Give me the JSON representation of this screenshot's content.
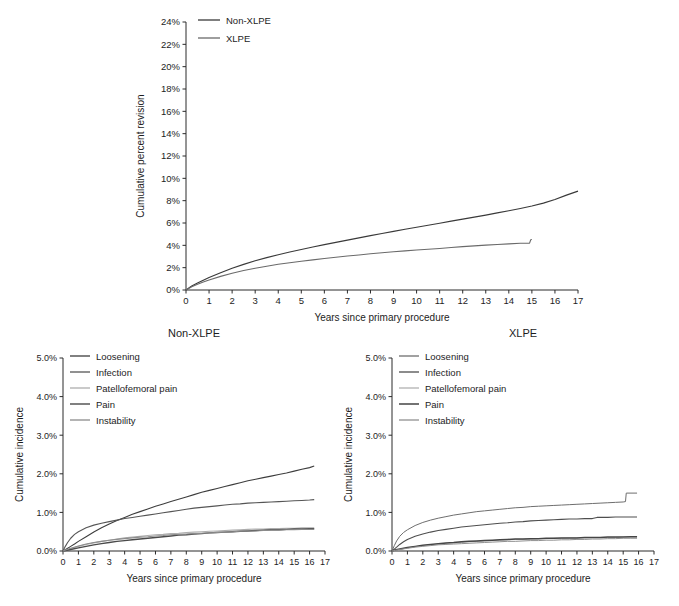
{
  "figure": {
    "title": "",
    "background": "#ffffff"
  },
  "chart_data": [
    {
      "id": "top",
      "type": "line",
      "title": "",
      "xlabel": "Years since primary procedure",
      "ylabel": "Cumulative percent revision",
      "xlim": [
        0,
        17
      ],
      "ylim": [
        0,
        24
      ],
      "xticks": [
        "0",
        "1",
        "2",
        "3",
        "4",
        "5",
        "6",
        "7",
        "8",
        "9",
        "10",
        "11",
        "12",
        "13",
        "14",
        "15",
        "16",
        "17"
      ],
      "yticks": [
        "0%",
        "2%",
        "4%",
        "6%",
        "8%",
        "10%",
        "12%",
        "14%",
        "16%",
        "18%",
        "20%",
        "22%",
        "24%"
      ],
      "grid": false,
      "legend_position": "top-left",
      "series": [
        {
          "name": "Non-XLPE",
          "color": "#3a3a3a",
          "width": 1.2,
          "x": [
            0,
            0.25,
            0.5,
            0.75,
            1,
            1.5,
            2,
            2.5,
            3,
            3.5,
            4,
            4.5,
            5,
            5.5,
            6,
            6.5,
            7,
            7.5,
            8,
            8.5,
            9,
            9.5,
            10,
            10.5,
            11,
            11.5,
            12,
            12.5,
            13,
            13.5,
            14,
            14.5,
            15,
            15.5,
            16,
            16.5,
            17
          ],
          "y": [
            0,
            0.35,
            0.62,
            0.88,
            1.12,
            1.55,
            1.95,
            2.3,
            2.62,
            2.9,
            3.16,
            3.4,
            3.63,
            3.85,
            4.06,
            4.27,
            4.47,
            4.67,
            4.87,
            5.06,
            5.25,
            5.44,
            5.62,
            5.8,
            5.98,
            6.16,
            6.34,
            6.52,
            6.7,
            6.9,
            7.1,
            7.3,
            7.52,
            7.78,
            8.1,
            8.5,
            8.85
          ]
        },
        {
          "name": "XLPE",
          "color": "#6a6a6a",
          "width": 1.1,
          "x": [
            0,
            0.25,
            0.5,
            0.75,
            1,
            1.5,
            2,
            2.5,
            3,
            3.5,
            4,
            4.5,
            5,
            5.5,
            6,
            6.5,
            7,
            7.5,
            8,
            8.5,
            9,
            9.5,
            10,
            10.5,
            11,
            11.5,
            12,
            12.5,
            13,
            13.5,
            14,
            14.5,
            14.9,
            14.95,
            15
          ],
          "y": [
            0,
            0.3,
            0.52,
            0.72,
            0.9,
            1.22,
            1.5,
            1.74,
            1.95,
            2.13,
            2.3,
            2.44,
            2.58,
            2.7,
            2.82,
            2.93,
            3.04,
            3.14,
            3.24,
            3.33,
            3.42,
            3.5,
            3.58,
            3.65,
            3.72,
            3.8,
            3.88,
            3.95,
            4.02,
            4.08,
            4.13,
            4.18,
            4.2,
            4.5,
            4.52
          ]
        }
      ]
    },
    {
      "id": "bottom-left",
      "type": "line",
      "title": "Non-XLPE",
      "xlabel": "Years since primary procedure",
      "ylabel": "Cumulative incidence",
      "xlim": [
        0,
        17
      ],
      "ylim": [
        0,
        5
      ],
      "xticks": [
        "0",
        "1",
        "2",
        "3",
        "4",
        "5",
        "6",
        "7",
        "8",
        "9",
        "10",
        "11",
        "12",
        "13",
        "14",
        "15",
        "16",
        "17"
      ],
      "yticks": [
        "0.0%",
        "1.0%",
        "2.0%",
        "3.0%",
        "4.0%",
        "5.0%"
      ],
      "grid": false,
      "legend_position": "top-left",
      "series": [
        {
          "name": "Loosening",
          "color": "#3d3d3d",
          "width": 1.1,
          "x": [
            0,
            0.25,
            0.5,
            0.75,
            1,
            1.5,
            2,
            2.5,
            3,
            3.5,
            4,
            4.5,
            5,
            5.5,
            6,
            6.5,
            7,
            7.5,
            8,
            8.5,
            9,
            9.5,
            10,
            10.5,
            11,
            11.5,
            12,
            12.5,
            13,
            13.5,
            14,
            14.5,
            15,
            15.5,
            16,
            16.3
          ],
          "y": [
            0,
            0.06,
            0.12,
            0.18,
            0.25,
            0.37,
            0.49,
            0.6,
            0.7,
            0.79,
            0.87,
            0.95,
            1.02,
            1.09,
            1.16,
            1.22,
            1.28,
            1.34,
            1.4,
            1.46,
            1.52,
            1.57,
            1.62,
            1.67,
            1.72,
            1.77,
            1.82,
            1.86,
            1.9,
            1.94,
            1.98,
            2.02,
            2.07,
            2.12,
            2.16,
            2.2
          ]
        },
        {
          "name": "Infection",
          "color": "#555555",
          "width": 1.1,
          "x": [
            0,
            0.15,
            0.3,
            0.5,
            0.75,
            1,
            1.5,
            2,
            2.5,
            3,
            3.5,
            4,
            4.5,
            5,
            5.5,
            6,
            6.5,
            7,
            7.5,
            8,
            8.5,
            9,
            9.5,
            10,
            10.5,
            11,
            11.5,
            12,
            12.5,
            13,
            13.5,
            14,
            14.5,
            15,
            15.5,
            16,
            16.3
          ],
          "y": [
            0,
            0.12,
            0.22,
            0.33,
            0.43,
            0.5,
            0.6,
            0.67,
            0.72,
            0.76,
            0.8,
            0.84,
            0.87,
            0.9,
            0.93,
            0.96,
            0.99,
            1.02,
            1.05,
            1.08,
            1.11,
            1.13,
            1.15,
            1.17,
            1.19,
            1.21,
            1.22,
            1.24,
            1.25,
            1.26,
            1.27,
            1.28,
            1.29,
            1.3,
            1.31,
            1.32,
            1.33
          ]
        },
        {
          "name": "Patellofemoral pain",
          "color": "#adadad",
          "width": 1.1,
          "x": [
            0,
            0.25,
            0.5,
            1,
            1.5,
            2,
            2.5,
            3,
            3.5,
            4,
            4.5,
            5,
            5.5,
            6,
            6.5,
            7,
            7.5,
            8,
            8.5,
            9,
            9.5,
            10,
            10.5,
            11,
            11.5,
            12,
            12.5,
            13,
            13.5,
            14,
            14.5,
            15,
            15.5,
            16,
            16.3
          ],
          "y": [
            0,
            0.03,
            0.06,
            0.12,
            0.17,
            0.21,
            0.25,
            0.28,
            0.31,
            0.34,
            0.36,
            0.38,
            0.4,
            0.42,
            0.43,
            0.45,
            0.46,
            0.48,
            0.49,
            0.5,
            0.51,
            0.52,
            0.53,
            0.54,
            0.55,
            0.56,
            0.57,
            0.57,
            0.58,
            0.58,
            0.59,
            0.59,
            0.6,
            0.6,
            0.6
          ]
        },
        {
          "name": "Pain",
          "color": "#4a4a4a",
          "width": 1.4,
          "x": [
            0,
            0.25,
            0.5,
            1,
            1.5,
            2,
            2.5,
            3,
            3.5,
            4,
            4.5,
            5,
            5.5,
            6,
            6.5,
            7,
            7.5,
            8,
            8.5,
            9,
            9.5,
            10,
            10.5,
            11,
            11.5,
            12,
            12.5,
            13,
            13.5,
            14,
            14.5,
            15,
            15.5,
            16,
            16.3
          ],
          "y": [
            0,
            0.02,
            0.04,
            0.08,
            0.12,
            0.16,
            0.19,
            0.22,
            0.25,
            0.27,
            0.29,
            0.31,
            0.33,
            0.35,
            0.37,
            0.39,
            0.41,
            0.42,
            0.44,
            0.45,
            0.47,
            0.48,
            0.49,
            0.5,
            0.51,
            0.52,
            0.53,
            0.54,
            0.55,
            0.55,
            0.56,
            0.57,
            0.57,
            0.58,
            0.58
          ]
        },
        {
          "name": "Instability",
          "color": "#8c8c8c",
          "width": 1.1,
          "x": [
            0,
            0.25,
            0.5,
            1,
            1.5,
            2,
            2.5,
            3,
            3.5,
            4,
            4.5,
            5,
            5.5,
            6,
            6.5,
            7,
            7.5,
            8,
            8.5,
            9,
            9.5,
            10,
            10.5,
            11,
            11.5,
            12,
            12.5,
            13,
            13.5,
            14,
            14.5,
            15,
            15.5,
            16,
            16.3
          ],
          "y": [
            0,
            0.04,
            0.07,
            0.13,
            0.18,
            0.22,
            0.25,
            0.28,
            0.3,
            0.32,
            0.34,
            0.36,
            0.37,
            0.39,
            0.4,
            0.42,
            0.43,
            0.44,
            0.45,
            0.46,
            0.47,
            0.48,
            0.49,
            0.5,
            0.51,
            0.52,
            0.52,
            0.53,
            0.54,
            0.54,
            0.55,
            0.55,
            0.56,
            0.56,
            0.56
          ]
        }
      ]
    },
    {
      "id": "bottom-right",
      "type": "line",
      "title": "XLPE",
      "xlabel": "Years since primary procedure",
      "ylabel": "Cumulative incidence",
      "xlim": [
        0,
        17
      ],
      "ylim": [
        0,
        5
      ],
      "xticks": [
        "0",
        "1",
        "2",
        "3",
        "4",
        "5",
        "6",
        "7",
        "8",
        "9",
        "10",
        "11",
        "12",
        "13",
        "14",
        "15",
        "16",
        "17"
      ],
      "yticks": [
        "0.0%",
        "1.0%",
        "2.0%",
        "3.0%",
        "4.0%",
        "5.0%"
      ],
      "grid": false,
      "legend_position": "top-left",
      "annotations": [
        {
          "text": "step increase",
          "x": 15.2,
          "y": 1.5
        }
      ],
      "series": [
        {
          "name": "Loosening",
          "color": "#6e6e6e",
          "width": 1.0,
          "x": [
            0,
            0.15,
            0.3,
            0.5,
            0.75,
            1,
            1.5,
            2,
            2.5,
            3,
            3.5,
            4,
            4.5,
            5,
            5.5,
            6,
            6.5,
            7,
            7.5,
            8,
            8.5,
            9,
            9.5,
            10,
            10.5,
            11,
            11.5,
            12,
            12.5,
            13,
            13.5,
            14,
            14.5,
            15,
            15.15,
            15.2,
            15.9
          ],
          "y": [
            0,
            0.14,
            0.26,
            0.38,
            0.48,
            0.55,
            0.66,
            0.74,
            0.8,
            0.85,
            0.89,
            0.93,
            0.96,
            0.99,
            1.02,
            1.04,
            1.06,
            1.08,
            1.1,
            1.12,
            1.13,
            1.15,
            1.16,
            1.17,
            1.18,
            1.19,
            1.2,
            1.21,
            1.22,
            1.23,
            1.24,
            1.25,
            1.26,
            1.27,
            1.28,
            1.5,
            1.5
          ]
        },
        {
          "name": "Infection",
          "color": "#4e4e4e",
          "width": 1.1,
          "x": [
            0,
            0.15,
            0.3,
            0.5,
            0.75,
            1,
            1.5,
            2,
            2.5,
            3,
            3.5,
            4,
            4.5,
            5,
            5.5,
            6,
            6.5,
            7,
            7.5,
            8,
            8.5,
            9,
            9.5,
            10,
            10.5,
            11,
            11.5,
            12,
            12.5,
            13,
            13.3,
            13.5,
            14,
            14.5,
            15,
            15.5,
            15.9
          ],
          "y": [
            0,
            0.05,
            0.1,
            0.17,
            0.24,
            0.3,
            0.38,
            0.44,
            0.49,
            0.53,
            0.56,
            0.59,
            0.62,
            0.64,
            0.66,
            0.68,
            0.7,
            0.72,
            0.73,
            0.75,
            0.76,
            0.78,
            0.79,
            0.8,
            0.81,
            0.82,
            0.83,
            0.83,
            0.84,
            0.84,
            0.87,
            0.87,
            0.87,
            0.88,
            0.88,
            0.88,
            0.88
          ]
        },
        {
          "name": "Patellofemoral pain",
          "color": "#b0b0b0",
          "width": 1.0,
          "x": [
            0,
            0.25,
            0.5,
            1,
            1.5,
            2,
            2.5,
            3,
            3.5,
            4,
            4.5,
            5,
            5.5,
            6,
            6.5,
            7,
            7.5,
            8,
            8.5,
            9,
            9.5,
            10,
            10.5,
            11,
            11.5,
            12,
            12.5,
            13,
            13.5,
            14,
            14.5,
            15,
            15.5,
            15.9
          ],
          "y": [
            0,
            0.02,
            0.04,
            0.08,
            0.11,
            0.14,
            0.16,
            0.18,
            0.2,
            0.21,
            0.22,
            0.24,
            0.25,
            0.26,
            0.27,
            0.28,
            0.29,
            0.3,
            0.3,
            0.31,
            0.32,
            0.32,
            0.33,
            0.33,
            0.34,
            0.34,
            0.34,
            0.35,
            0.35,
            0.35,
            0.35,
            0.36,
            0.36,
            0.36
          ]
        },
        {
          "name": "Pain",
          "color": "#454545",
          "width": 1.5,
          "x": [
            0,
            0.25,
            0.5,
            1,
            1.5,
            2,
            2.5,
            3,
            3.5,
            4,
            4.5,
            5,
            5.5,
            6,
            6.5,
            7,
            7.5,
            8,
            8.5,
            9,
            9.5,
            10,
            10.5,
            11,
            11.5,
            12,
            12.5,
            13,
            13.5,
            14,
            14.5,
            15,
            15.5,
            15.9
          ],
          "y": [
            0,
            0.03,
            0.05,
            0.09,
            0.12,
            0.15,
            0.17,
            0.19,
            0.21,
            0.22,
            0.24,
            0.25,
            0.26,
            0.27,
            0.28,
            0.29,
            0.3,
            0.31,
            0.31,
            0.32,
            0.32,
            0.33,
            0.33,
            0.34,
            0.34,
            0.34,
            0.35,
            0.35,
            0.35,
            0.36,
            0.36,
            0.36,
            0.37,
            0.37
          ]
        },
        {
          "name": "Instability",
          "color": "#909090",
          "width": 1.0,
          "x": [
            0,
            0.25,
            0.5,
            1,
            1.5,
            2,
            2.5,
            3,
            3.5,
            4,
            4.5,
            5,
            5.5,
            6,
            6.5,
            7,
            7.5,
            8,
            8.5,
            9,
            9.5,
            10,
            10.5,
            11,
            11.5,
            12,
            12.5,
            13,
            13.5,
            14,
            14.5,
            15,
            15.5,
            15.9
          ],
          "y": [
            0,
            0.02,
            0.04,
            0.07,
            0.1,
            0.12,
            0.14,
            0.16,
            0.17,
            0.18,
            0.19,
            0.2,
            0.21,
            0.22,
            0.23,
            0.24,
            0.25,
            0.25,
            0.26,
            0.27,
            0.27,
            0.28,
            0.28,
            0.29,
            0.29,
            0.3,
            0.3,
            0.31,
            0.31,
            0.32,
            0.32,
            0.33,
            0.33,
            0.33
          ]
        }
      ]
    }
  ]
}
